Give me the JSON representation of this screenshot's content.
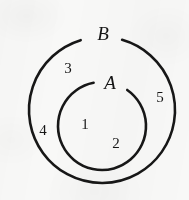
{
  "figure": {
    "kind": "set-diagram",
    "background_color": "#f8f8f7",
    "stroke_color": "#171717",
    "width": 189,
    "height": 200
  },
  "sets": [
    {
      "id": "outer-set",
      "label": "B",
      "label_x": 103,
      "label_y": 33,
      "center_x": 102,
      "center_y": 110,
      "radius": 73,
      "stroke_width": 2.6,
      "gap_start_deg": -107,
      "gap_end_deg": -74
    },
    {
      "id": "inner-set",
      "label": "A",
      "label_x": 110,
      "label_y": 82,
      "center_x": 102,
      "center_y": 126,
      "radius": 44,
      "stroke_width": 2.6,
      "gap_start_deg": -101,
      "gap_end_deg": -55
    }
  ],
  "regions": [
    {
      "id": "region-1",
      "label": "1",
      "x": 85,
      "y": 124,
      "zone": "inside-A"
    },
    {
      "id": "region-2",
      "label": "2",
      "x": 116,
      "y": 143,
      "zone": "inside-A"
    },
    {
      "id": "region-3",
      "label": "3",
      "x": 68,
      "y": 68,
      "zone": "between-A-and-B"
    },
    {
      "id": "region-4",
      "label": "4",
      "x": 43,
      "y": 130,
      "zone": "between-A-and-B"
    },
    {
      "id": "region-5",
      "label": "5",
      "x": 160,
      "y": 97,
      "zone": "between-A-and-B"
    }
  ]
}
